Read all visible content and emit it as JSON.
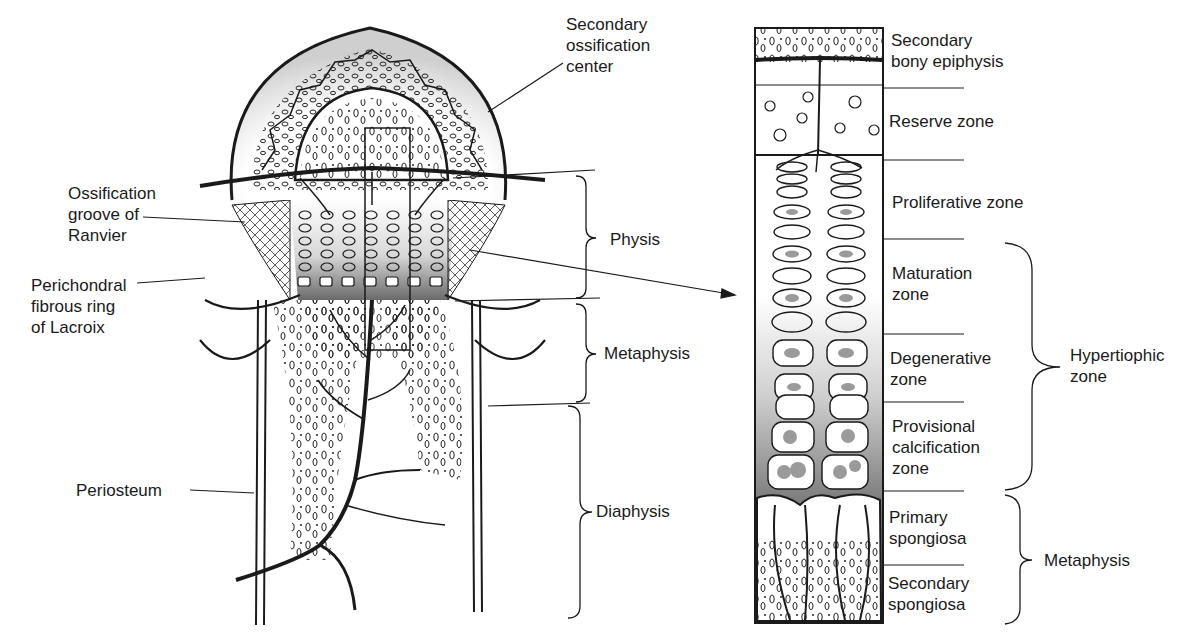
{
  "left_figure": {
    "labels": {
      "secondary_ossification_center": "Secondary\nossification\ncenter",
      "ossification_groove": "Ossification\ngroove of\nRanvier",
      "perichondral_ring": "Perichondral\nfibrous ring\nof Lacroix",
      "periosteum": "Periosteum",
      "physis": "Physis",
      "metaphysis": "Metaphysis",
      "diaphysis": "Diaphysis"
    }
  },
  "right_figure": {
    "zones": [
      {
        "label": "Secondary\nbony epiphysis"
      },
      {
        "label": "Reserve zone"
      },
      {
        "label": "Proliferative zone"
      },
      {
        "label": "Maturation\nzone"
      },
      {
        "label": "Degenerative\nzone"
      },
      {
        "label": "Provisional\ncalcification\nzone"
      },
      {
        "label": "Primary\nspongiosa"
      },
      {
        "label": "Secondary\nspongiosa"
      }
    ],
    "groups": {
      "hypertrophic": "Hypertiophic\nzone",
      "metaphysis": "Metaphysis"
    }
  },
  "colors": {
    "ink": "#1a1a1a",
    "shade": "#6e6e6e",
    "paper": "#ffffff"
  }
}
